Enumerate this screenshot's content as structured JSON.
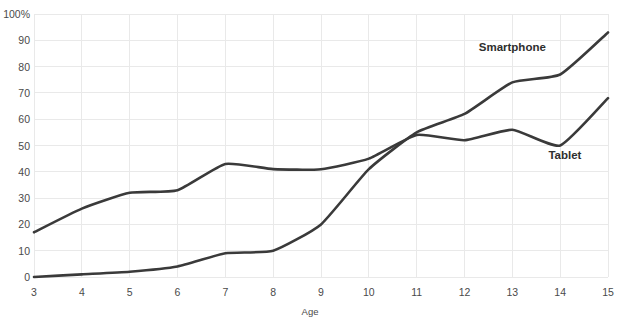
{
  "chart_data": {
    "type": "line",
    "title": "",
    "title_note": "title clipped off top edge of screenshot",
    "xlabel": "Age",
    "ylabel": "",
    "x": [
      3,
      4,
      5,
      6,
      7,
      8,
      9,
      10,
      11,
      12,
      13,
      14,
      15
    ],
    "categories": [
      "3",
      "4",
      "5",
      "6",
      "7",
      "8",
      "9",
      "10",
      "11",
      "12",
      "13",
      "14",
      "15"
    ],
    "xlim": [
      3,
      15
    ],
    "ylim": [
      0,
      100
    ],
    "yticks": [
      0,
      10,
      20,
      30,
      40,
      50,
      60,
      70,
      80,
      90,
      100
    ],
    "ytick_labels": [
      "0",
      "10",
      "20",
      "30",
      "40",
      "50",
      "60",
      "70",
      "80",
      "90",
      "100%"
    ],
    "xticks": [
      3,
      4,
      5,
      6,
      7,
      8,
      9,
      10,
      11,
      12,
      13,
      14,
      15
    ],
    "xtick_labels": [
      "3",
      "4",
      "5",
      "6",
      "7",
      "8",
      "9",
      "10",
      "11",
      "12",
      "13",
      "14",
      "15"
    ],
    "grid": true,
    "legend_position": "inline-labels",
    "series": [
      {
        "name": "Smartphone",
        "color": "#3a3a3a",
        "values": [
          0,
          1,
          2,
          4,
          9,
          10,
          20,
          41,
          55,
          62,
          74,
          77,
          93
        ]
      },
      {
        "name": "Tablet",
        "color": "#3a3a3a",
        "values": [
          17,
          26,
          32,
          33,
          43,
          41,
          41,
          45,
          54,
          52,
          56,
          50,
          68
        ]
      }
    ],
    "annotations": [
      {
        "text": "Smartphone",
        "x": 13.0,
        "y": 86
      },
      {
        "text": "Tablet",
        "x": 14.1,
        "y": 45
      }
    ],
    "crossover": {
      "x": 10.3,
      "y": 54
    }
  },
  "axes": {
    "y_axis_unit_label": "100%",
    "x_axis_title": "Age"
  }
}
